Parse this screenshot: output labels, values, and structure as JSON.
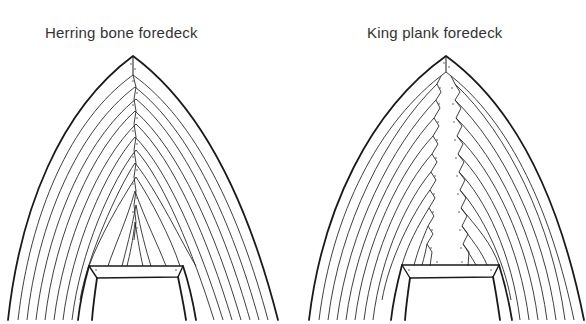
{
  "figure": {
    "diagrams": [
      {
        "id": "herring-bone",
        "title": "Herring bone foredeck",
        "style": "planks meet at centerline in chevron pattern",
        "plank_count_per_side": 10
      },
      {
        "id": "king-plank",
        "title": "King plank foredeck",
        "style": "planks nibbed into central king plank",
        "plank_count_per_side": 10
      }
    ],
    "colors": {
      "line": "#1a1a1a",
      "background": "#ffffff",
      "text": "#333333"
    }
  }
}
